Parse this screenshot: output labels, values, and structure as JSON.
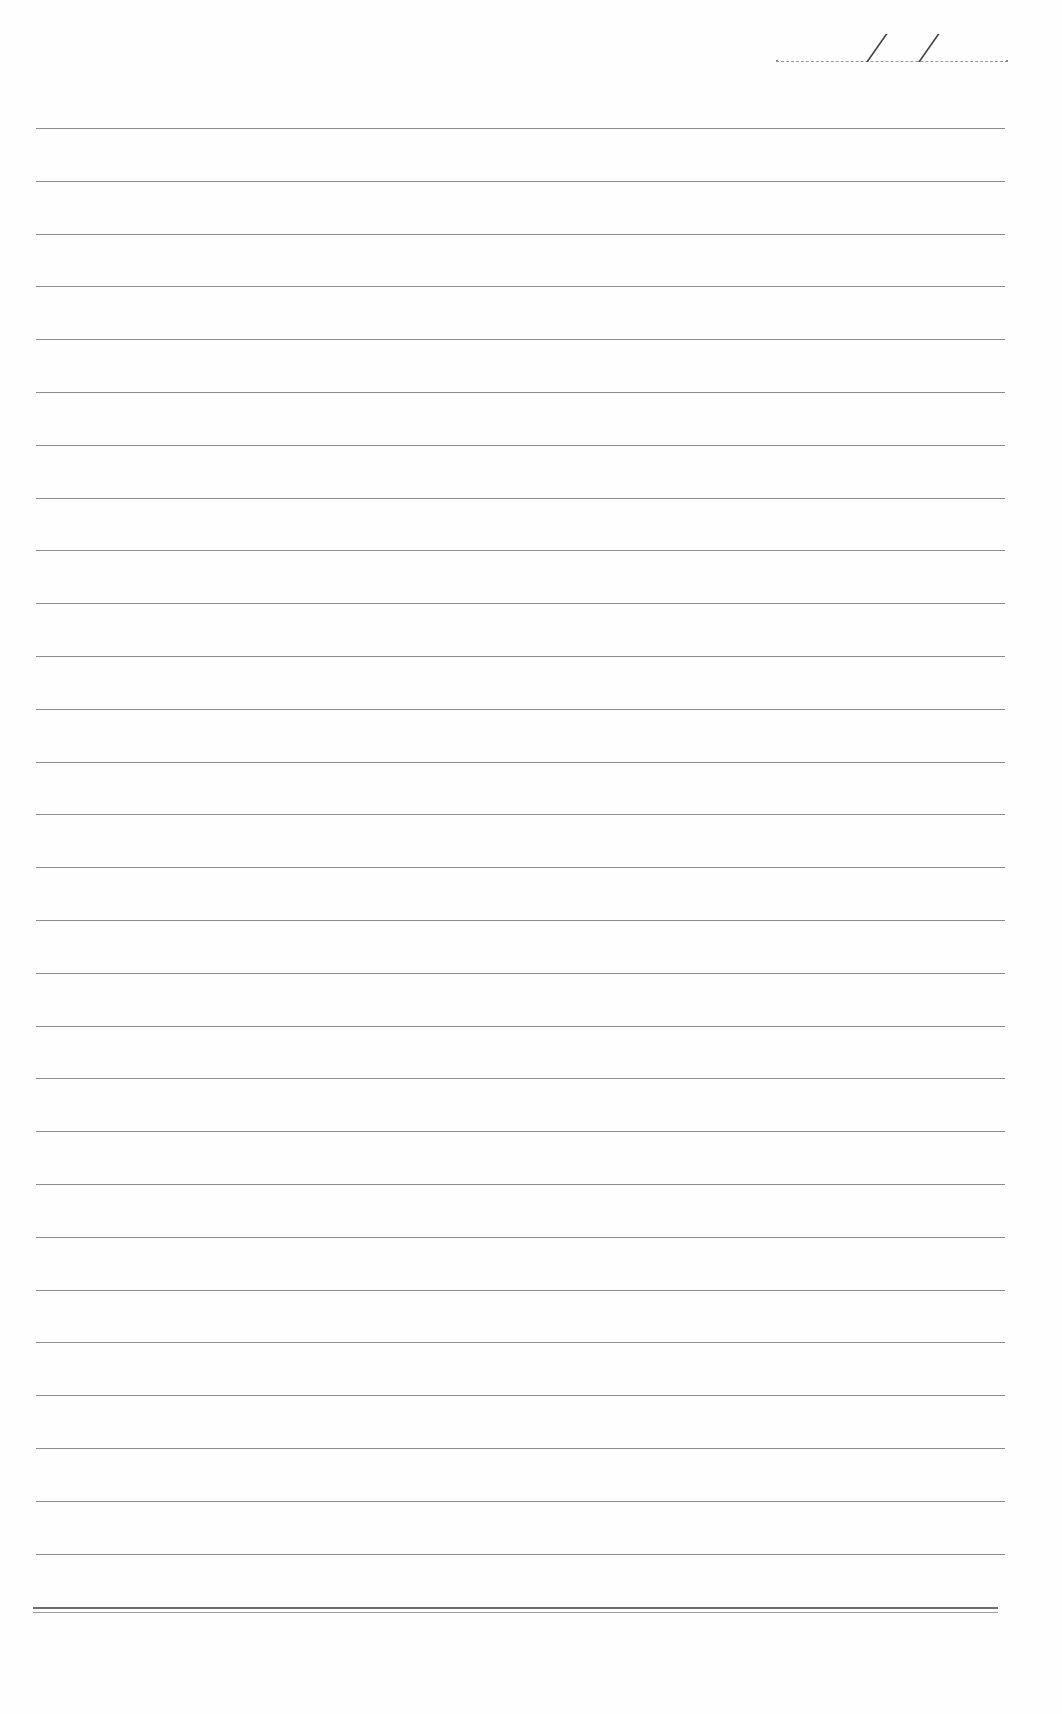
{
  "page": {
    "type": "lined-notebook-page",
    "background_color": "#fefefe",
    "line_color": "#8c8c8c",
    "date_field": {
      "label": "",
      "separator": "/",
      "value": ""
    },
    "ruled_lines": {
      "count": 28,
      "first_y": 128,
      "spacing": 52.8,
      "left_x": 36,
      "right_x": 1005
    },
    "bottom_rule": {
      "y": 1608,
      "style": "double"
    },
    "content": []
  }
}
